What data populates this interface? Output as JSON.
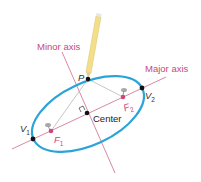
{
  "diagram": {
    "labels": {
      "minor_axis": "Minor axis",
      "major_axis": "Major axis",
      "point_p": "P",
      "vertex1": "V",
      "vertex1_sub": "1",
      "vertex2": "V",
      "vertex2_sub": "2",
      "focus1": "F",
      "focus1_sub": "1",
      "focus2": "F",
      "focus2_sub": "2",
      "center": "Center"
    },
    "colors": {
      "ellipse": "#2aa3d8",
      "axis_line": "#d47a9a",
      "axis_label": "#c9487a",
      "focus": "#d0457a",
      "string": "#b8b8b8",
      "pencil_body": "#f3df8a",
      "pencil_tip": "#333333",
      "point": "#111111"
    },
    "icons": {
      "pencil": "pencil-icon",
      "pin1": "pushpin-icon",
      "pin2": "pushpin-icon"
    }
  }
}
